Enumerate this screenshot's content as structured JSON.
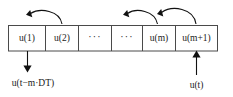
{
  "figure": {
    "colors": {
      "background": "#ffffff",
      "box_stroke": "#4a4a4a",
      "arrow": "#111111",
      "text": "#1a1a1a"
    }
  },
  "register": {
    "cells": [
      {
        "id": "cell-1",
        "label": "u(1)",
        "kind": "value"
      },
      {
        "id": "cell-2",
        "label": "u(2)",
        "kind": "value"
      },
      {
        "id": "cell-3",
        "label": "···",
        "kind": "ellipsis"
      },
      {
        "id": "cell-4",
        "label": "···",
        "kind": "ellipsis"
      },
      {
        "id": "cell-5",
        "label": "u(m)",
        "kind": "value"
      },
      {
        "id": "cell-6",
        "label": "u(m+1)",
        "kind": "value"
      }
    ]
  },
  "shift_arrows": [
    {
      "id": "shift-arrow-1",
      "from_cell": "cell-2",
      "to_cell": "cell-1",
      "direction": "left"
    },
    {
      "id": "shift-arrow-2",
      "from_cell": "cell-5",
      "to_cell": "cell-4",
      "direction": "left"
    },
    {
      "id": "shift-arrow-3",
      "from_cell": "cell-6",
      "to_cell": "cell-5",
      "direction": "left"
    }
  ],
  "ports": {
    "output": {
      "id": "output-port",
      "label": "u(t−m·DT)",
      "attached_cell": "cell-1",
      "direction": "down"
    },
    "input": {
      "id": "input-port",
      "label": "u(t)",
      "attached_cell": "cell-6",
      "direction": "up"
    }
  }
}
